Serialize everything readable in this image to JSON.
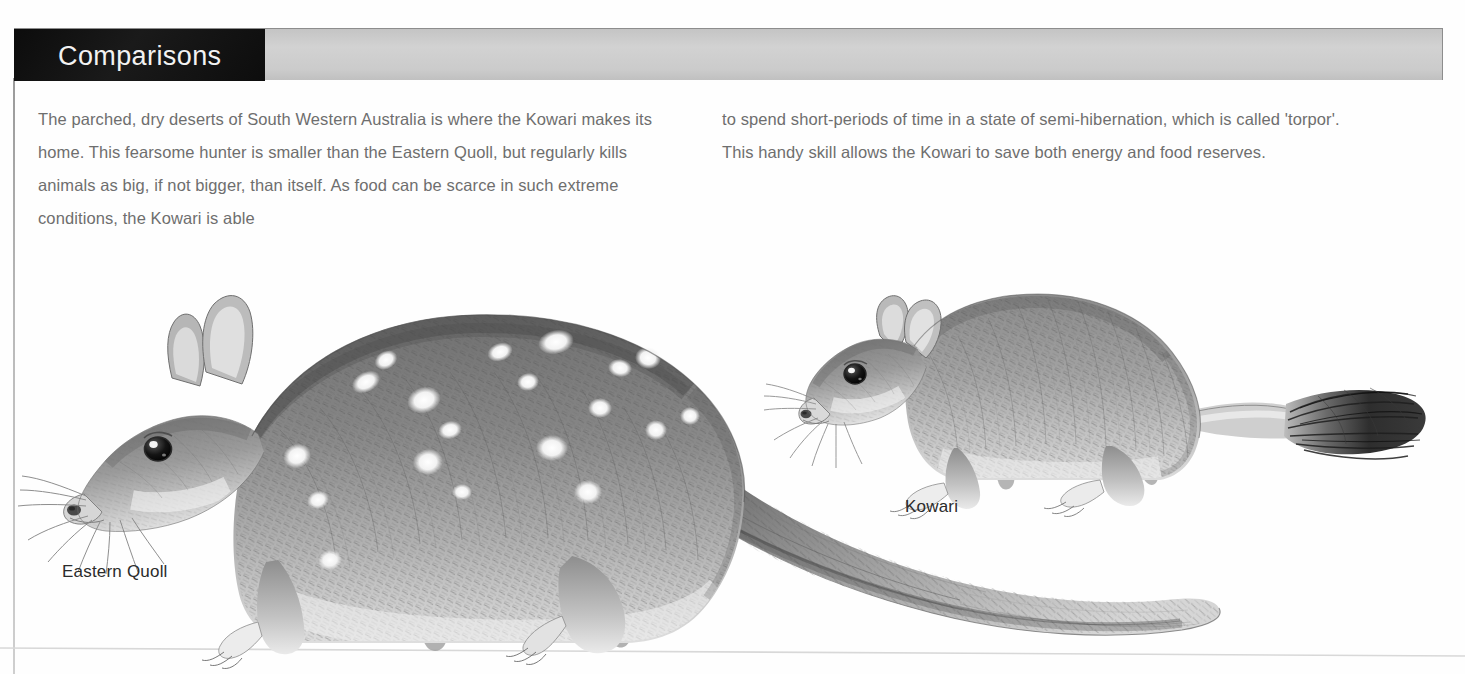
{
  "header": {
    "title": "Comparisons",
    "black_block_color": "#111111",
    "banner_color": "#cfcfcf"
  },
  "body": {
    "left_column": "The parched, dry deserts of South Western Australia is where the Kowari makes its home. This fearsome hunter is smaller than the Eastern Quoll, but regularly kills animals as big, if not bigger, than itself. As food can be scarce in such extreme conditions, the Kowari is able",
    "right_column": "to spend short-periods of time in a state of semi-hibernation, which is called 'torpor'. This handy skill allows the Kowari to save both energy and food reserves.",
    "text_color": "#6e6e6e"
  },
  "figure": {
    "captions": [
      {
        "id": "eastern-quoll",
        "label": "Eastern Quoll"
      },
      {
        "id": "kowari",
        "label": "Kowari"
      }
    ],
    "illustration_style": "graphite pencil drawing",
    "subjects": [
      {
        "name": "Eastern Quoll",
        "description": "Large spotted marsupial shown in left profile facing left, with white spots across dark body, long tapering tail, upright rounded ears and long whiskers.",
        "relative_size": "larger"
      },
      {
        "name": "Kowari",
        "description": "Small crouching marsupial facing left with a plain grey coat, large dark eye, rounded ears and a black brush-tipped tail.",
        "relative_size": "smaller"
      }
    ]
  }
}
